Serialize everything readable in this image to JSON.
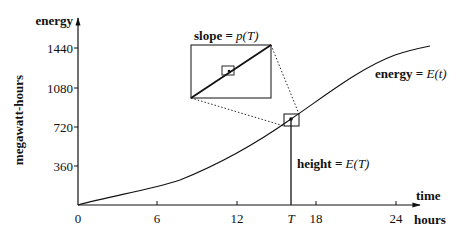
{
  "diagram": {
    "y_axis": {
      "label": "energy",
      "unit_label": "megawatt-hours",
      "ticks": [
        "1440",
        "1080",
        "720",
        "360"
      ]
    },
    "x_axis": {
      "label": "time",
      "unit_label": "hours",
      "ticks": [
        "0",
        "6",
        "12",
        "18",
        "24"
      ],
      "special_tick": "T"
    },
    "curve_label": {
      "prefix": "energy = ",
      "func": "E",
      "arg": "(t)"
    },
    "slope_label": {
      "prefix": "slope = ",
      "func": "p",
      "arg": "(T)"
    },
    "height_label": {
      "prefix": "height = ",
      "func": "E",
      "arg": "(T)"
    },
    "colors": {
      "line": "#111111",
      "background": "#ffffff"
    }
  }
}
